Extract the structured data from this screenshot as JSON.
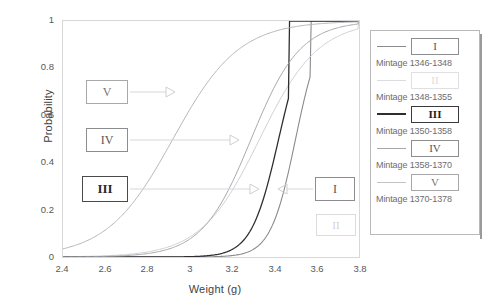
{
  "chart_data": {
    "type": "line",
    "title": "",
    "xlabel": "Weight (g)",
    "ylabel": "Probability",
    "xlim": [
      2.4,
      3.8
    ],
    "ylim": [
      0,
      1
    ],
    "xticks": [
      "2.4",
      "2.6",
      "2.8",
      "3",
      "3.2",
      "3.4",
      "3.6",
      "3.8"
    ],
    "yticks": [
      "0",
      "0.2",
      "0.4",
      "0.6",
      "0.8",
      "1"
    ],
    "grid": false,
    "legend_position": "right",
    "series": [
      {
        "name": "I",
        "label": "Mintage 1346-1348",
        "color": "#8a8a8e",
        "width": 1.1,
        "midpoint": 3.5,
        "slope": 17.0,
        "plateau_x": 3.57
      },
      {
        "name": "II",
        "label": "Mintage 1348-1355",
        "color": "#cfcfd4",
        "width": 1.0,
        "midpoint": 3.33,
        "slope": 7.2,
        "plateau_x": 3.8
      },
      {
        "name": "III",
        "label": "Mintage 1350-1358",
        "color": "#2e2e30",
        "width": 1.3,
        "midpoint": 3.42,
        "slope": 15.5,
        "plateau_x": 3.47
      },
      {
        "name": "IV",
        "label": "Mintage 1358-1370",
        "color": "#a6a6ab",
        "width": 1.0,
        "midpoint": 3.29,
        "slope": 8.6,
        "plateau_x": 3.8
      },
      {
        "name": "V",
        "label": "Mintage 1370-1378",
        "color": "#b4b4b9",
        "width": 1.0,
        "midpoint": 2.92,
        "slope": 6.4,
        "plateau_x": 3.8
      }
    ]
  },
  "annotations": [
    {
      "name": "V",
      "style": "light",
      "x": 86,
      "y": 80,
      "w": 42,
      "h": 24,
      "arrow_to_x": 175,
      "arrow_dir": "right"
    },
    {
      "name": "IV",
      "style": "mid",
      "x": 86,
      "y": 128,
      "w": 42,
      "h": 24,
      "arrow_to_x": 239,
      "arrow_dir": "right"
    },
    {
      "name": "III",
      "style": "dark",
      "x": 82,
      "y": 176,
      "w": 46,
      "h": 26,
      "arrow_to_x": 259,
      "arrow_dir": "right"
    },
    {
      "name": "I",
      "style": "mid",
      "x": 315,
      "y": 177,
      "w": 40,
      "h": 24,
      "arrow_to_x": 278,
      "arrow_dir": "left"
    },
    {
      "name": "II",
      "style": "faint",
      "x": 316,
      "y": 214,
      "w": 40,
      "h": 22,
      "arrow_to_x": 0,
      "arrow_dir": "none"
    }
  ],
  "legend": {
    "entries": [
      {
        "symbol": "I",
        "style": "mid",
        "swatch_color": "#8a8a8e",
        "swatch_width": 1.6,
        "caption": "Mintage 1346-1348"
      },
      {
        "symbol": "II",
        "style": "faint",
        "swatch_color": "#dcdce0",
        "swatch_width": 1.2,
        "caption": "Mintage 1348-1355"
      },
      {
        "symbol": "III",
        "style": "dark",
        "swatch_color": "#2e2e30",
        "swatch_width": 2.0,
        "caption": "Mintage 1350-1358"
      },
      {
        "symbol": "IV",
        "style": "mid",
        "swatch_color": "#a6a6ab",
        "swatch_width": 1.4,
        "caption": "Mintage 1358-1370"
      },
      {
        "symbol": "V",
        "style": "light",
        "swatch_color": "#c2c2c7",
        "swatch_width": 1.2,
        "caption": "Mintage 1370-1378"
      }
    ]
  }
}
